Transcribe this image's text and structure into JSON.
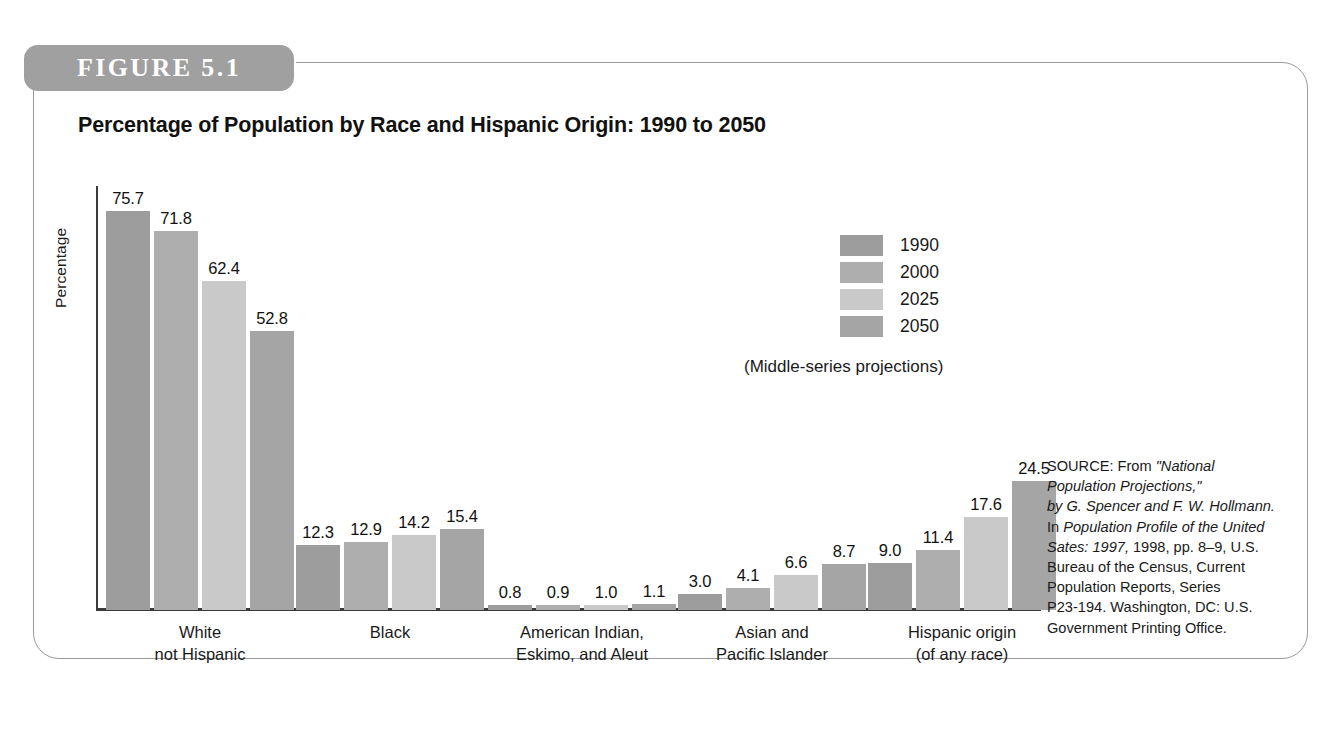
{
  "figure": {
    "tag_label": "FIGURE 5.1",
    "frame_color": "#9a9a9a",
    "tag_color": "#a0a0a0"
  },
  "chart_data": {
    "type": "bar",
    "title": "Percentage of Population by Race and Hispanic Origin: 1990 to 2050",
    "subtitle": "(Middle-series projections)",
    "xlabel": "",
    "ylabel": "Percentage",
    "ylim": [
      0,
      80
    ],
    "grid": false,
    "legend_position": "upper-right",
    "categories": [
      "White\nnot Hispanic",
      "Black",
      "American Indian,\nEskimo, and Aleut",
      "Asian and\nPacific Islander",
      "Hispanic origin\n(of any race)"
    ],
    "category_lines": [
      [
        "White",
        "not Hispanic"
      ],
      [
        "Black",
        ""
      ],
      [
        "American Indian,",
        "Eskimo, and Aleut"
      ],
      [
        "Asian and",
        "Pacific Islander"
      ],
      [
        "Hispanic origin",
        "(of any race)"
      ]
    ],
    "series": [
      {
        "name": "1990",
        "color": "#9d9d9d",
        "values": [
          75.7,
          12.3,
          0.8,
          3.0,
          9.0
        ]
      },
      {
        "name": "2000",
        "color": "#aeaeae",
        "values": [
          71.8,
          12.9,
          0.9,
          4.1,
          11.4
        ]
      },
      {
        "name": "2025",
        "color": "#c9c9c9",
        "values": [
          62.4,
          14.2,
          1.0,
          6.6,
          17.6
        ]
      },
      {
        "name": "2050",
        "color": "#a5a5a5",
        "values": [
          52.8,
          15.4,
          1.1,
          8.7,
          24.5
        ]
      }
    ],
    "value_labels": {
      "white": [
        "75.7",
        "71.8",
        "62.4",
        "52.8"
      ],
      "black": [
        "12.3",
        "12.9",
        "14.2",
        "15.4"
      ],
      "american_indian": [
        "0.8",
        "0.9",
        "1.0",
        "1.1"
      ],
      "asian": [
        "3.0",
        "4.1",
        "6.6",
        "8.7"
      ],
      "hispanic": [
        "9.0",
        "11.4",
        "17.6",
        "24.5"
      ]
    }
  },
  "source": {
    "lines": [
      "SOURCE: From \"National",
      "Population Projections,\"",
      "by G. Spencer and F. W. Hollmann.",
      "In Population Profile of the United",
      "Sates: 1997, 1998, pp. 8–9, U.S.",
      "Bureau of the Census, Current",
      "Population Reports, Series",
      "P23-194. Washington, DC: U.S.",
      "Government Printing Office."
    ]
  }
}
